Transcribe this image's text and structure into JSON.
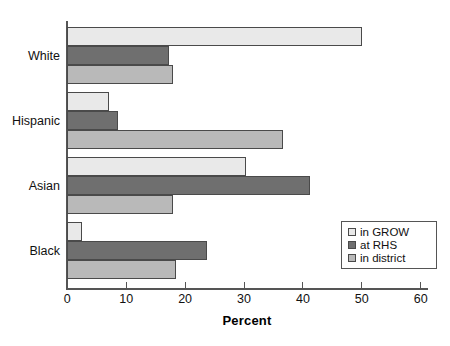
{
  "chart_data": {
    "type": "bar",
    "orientation": "horizontal",
    "title": "",
    "xlabel": "Percent",
    "ylabel": "",
    "xlim": [
      0,
      62
    ],
    "xticks": [
      0,
      10,
      20,
      30,
      40,
      50,
      60
    ],
    "xtick_labels": [
      "0",
      "10",
      "20",
      "30",
      "40",
      "50",
      "60"
    ],
    "grid": false,
    "legend_position": "lower right",
    "categories": [
      "White",
      "Hispanic",
      "Asian",
      "Black"
    ],
    "series": [
      {
        "name": "in GROW",
        "color": "#e9e9e9",
        "values": [
          50.0,
          7.0,
          30.3,
          2.5
        ]
      },
      {
        "name": "at RHS",
        "color": "#6f6f6f",
        "values": [
          17.3,
          8.6,
          41.2,
          23.8
        ]
      },
      {
        "name": "in district",
        "color": "#b9b9b9",
        "values": [
          17.9,
          36.6,
          17.9,
          18.4
        ]
      }
    ]
  },
  "legend": {
    "items": [
      {
        "label": "in GROW"
      },
      {
        "label": "at RHS"
      },
      {
        "label": "in district"
      }
    ]
  },
  "axis": {
    "x_title": "Percent"
  }
}
